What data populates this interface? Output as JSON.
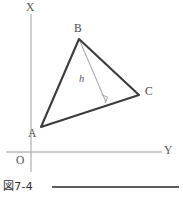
{
  "figure": {
    "caption": "図7-4",
    "axes": {
      "vertical_label": "X",
      "horizontal_label": "Y",
      "origin_label": "O",
      "axis_color": "#b4b4b4",
      "origin_x": 31,
      "origin_y": 152
    },
    "triangle": {
      "name": "triangle-ABC",
      "stroke_color": "#3c3c3c",
      "stroke_width": 2.1,
      "vertices": [
        {
          "label": "A",
          "x": 41,
          "y": 127
        },
        {
          "label": "B",
          "x": 79,
          "y": 39
        },
        {
          "label": "C",
          "x": 139,
          "y": 95
        }
      ]
    },
    "altitude": {
      "name": "altitude-h",
      "label": "h",
      "stroke_color": "#a9a9a9",
      "stroke_width": 1,
      "from_x": 79,
      "from_y": 39,
      "foot_x": 106,
      "foot_y": 102,
      "right_angle_marker": true
    },
    "canvas": {
      "width": 183,
      "height": 202,
      "background": "#ffffff"
    }
  }
}
